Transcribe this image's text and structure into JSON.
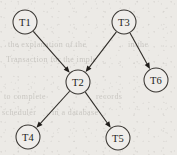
{
  "figure": {
    "background_color": "#eceae6",
    "node_fill_color": "#efedea",
    "stroke_color": "#2e2b27",
    "label_color": "#241f1b",
    "width": 177,
    "height": 155
  },
  "chart_data": {
    "type": "diagram",
    "subtype": "directed-acyclic-graph",
    "title": "",
    "xlabel": "",
    "ylabel": "",
    "grid": false,
    "legend": null,
    "node_radius": 12,
    "nodes": [
      {
        "id": "T1",
        "label": "T1",
        "x": 25,
        "y": 22
      },
      {
        "id": "T3",
        "label": "T3",
        "x": 124,
        "y": 22
      },
      {
        "id": "T2",
        "label": "T2",
        "x": 78,
        "y": 82
      },
      {
        "id": "T6",
        "label": "T6",
        "x": 156,
        "y": 80
      },
      {
        "id": "T4",
        "label": "T4",
        "x": 28,
        "y": 137
      },
      {
        "id": "T5",
        "label": "T5",
        "x": 118,
        "y": 138
      }
    ],
    "edges": [
      {
        "from": "T1",
        "to": "T2",
        "directed": true,
        "label": ""
      },
      {
        "from": "T3",
        "to": "T2",
        "directed": true,
        "label": ""
      },
      {
        "from": "T3",
        "to": "T6",
        "directed": true,
        "label": ""
      },
      {
        "from": "T2",
        "to": "T4",
        "directed": true,
        "label": ""
      },
      {
        "from": "T2",
        "to": "T5",
        "directed": true,
        "label": ""
      }
    ]
  },
  "ghost_text": [
    {
      "text": "the explanation of the",
      "x": 8,
      "y": 40
    },
    {
      "text": "in the",
      "x": 128,
      "y": 40
    },
    {
      "text": "Transaction for the imple",
      "x": 6,
      "y": 55
    },
    {
      "text": "to complete",
      "x": 4,
      "y": 92
    },
    {
      "text": "records",
      "x": 96,
      "y": 92
    },
    {
      "text": "scheduler",
      "x": 2,
      "y": 108
    },
    {
      "text": "in a database",
      "x": 52,
      "y": 108
    }
  ]
}
